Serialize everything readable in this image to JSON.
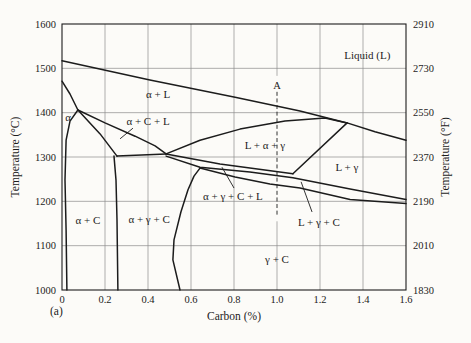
{
  "figure": {
    "label": "(a)",
    "background": "#fcfbf8",
    "line_color": "#1c1c1c",
    "grid_color": "#8c8c8c",
    "text_color": "#1c1c1c"
  },
  "chart_data": {
    "type": "line",
    "subtype": "phase-diagram",
    "xlabel": "Carbon (%)",
    "ylabel_left": "Temperature (°C)",
    "ylabel_right": "Temperature (°F)",
    "xlim": [
      0,
      1.6
    ],
    "ylim_left": [
      1000,
      1600
    ],
    "ylim_right": [
      1830,
      2910
    ],
    "grid": true,
    "x_ticks": [
      {
        "label": "0",
        "value": 0.0
      },
      {
        "label": "0.2",
        "value": 0.2
      },
      {
        "label": "0.4",
        "value": 0.4
      },
      {
        "label": "0.6",
        "value": 0.6
      },
      {
        "label": "0.8",
        "value": 0.8
      },
      {
        "label": "1.0",
        "value": 1.0
      },
      {
        "label": "1.2",
        "value": 1.2
      },
      {
        "label": "1.4",
        "value": 1.4
      },
      {
        "label": "1.6",
        "value": 1.6
      }
    ],
    "y_ticks_left": [
      {
        "label": "1600",
        "value": 1600
      },
      {
        "label": "1500",
        "value": 1500
      },
      {
        "label": "1400",
        "value": 1400
      },
      {
        "label": "1300",
        "value": 1300
      },
      {
        "label": "1200",
        "value": 1200
      },
      {
        "label": "1100",
        "value": 1100
      },
      {
        "label": "1000",
        "value": 1000
      }
    ],
    "y_ticks_right": [
      {
        "label": "2910",
        "value": 1600
      },
      {
        "label": "2730",
        "value": 1500
      },
      {
        "label": "2550",
        "value": 1400
      },
      {
        "label": "2370",
        "value": 1300
      },
      {
        "label": "2190",
        "value": 1200
      },
      {
        "label": "2010",
        "value": 1100
      },
      {
        "label": "1830",
        "value": 1000
      }
    ],
    "boundaries": [
      {
        "id": "liquidus",
        "points": [
          [
            0,
            1517
          ],
          [
            0.409,
            1474
          ],
          [
            0.805,
            1435
          ],
          [
            1.107,
            1404
          ],
          [
            1.326,
            1377
          ],
          [
            1.456,
            1357
          ],
          [
            1.6,
            1338
          ]
        ]
      },
      {
        "id": "alpha-upper-left",
        "points": [
          [
            0,
            1471
          ],
          [
            0.037,
            1442
          ],
          [
            0.074,
            1406
          ]
        ]
      },
      {
        "id": "alpha-right",
        "points": [
          [
            0.074,
            1406
          ],
          [
            0.037,
            1381
          ],
          [
            0.019,
            1338
          ],
          [
            0.014,
            1248
          ],
          [
            0.019,
            1135
          ],
          [
            0.023,
            1000
          ]
        ]
      },
      {
        "id": "alpha-c-l-left",
        "points": [
          [
            0.074,
            1406
          ],
          [
            0.177,
            1352
          ],
          [
            0.256,
            1302
          ]
        ]
      },
      {
        "id": "alpha-l-lower",
        "points": [
          [
            0.074,
            1406
          ],
          [
            0.2,
            1377
          ],
          [
            0.34,
            1347
          ],
          [
            0.433,
            1325
          ],
          [
            0.484,
            1307
          ]
        ]
      },
      {
        "id": "eutectic-shelf",
        "points": [
          [
            0.256,
            1302
          ],
          [
            0.484,
            1307
          ]
        ]
      },
      {
        "id": "l-alpha-gamma-upper",
        "points": [
          [
            0.484,
            1307
          ],
          [
            0.642,
            1338
          ],
          [
            0.828,
            1363
          ],
          [
            1.037,
            1381
          ],
          [
            1.223,
            1388
          ],
          [
            1.326,
            1377
          ]
        ]
      },
      {
        "id": "l-gamma-left",
        "points": [
          [
            1.326,
            1377
          ],
          [
            1.074,
            1262
          ]
        ]
      },
      {
        "id": "band-top",
        "points": [
          [
            0.484,
            1307
          ],
          [
            0.735,
            1284
          ],
          [
            1.074,
            1262
          ]
        ]
      },
      {
        "id": "band-middle",
        "points": [
          [
            0.484,
            1302
          ],
          [
            0.642,
            1277
          ],
          [
            0.874,
            1266
          ],
          [
            1.074,
            1253
          ],
          [
            1.34,
            1228
          ],
          [
            1.6,
            1204
          ]
        ]
      },
      {
        "id": "band-bottom",
        "points": [
          [
            0.642,
            1275
          ],
          [
            0.805,
            1255
          ],
          [
            0.967,
            1239
          ],
          [
            1.107,
            1230
          ],
          [
            1.34,
            1204
          ],
          [
            1.6,
            1195
          ]
        ]
      },
      {
        "id": "gamma-c-left",
        "points": [
          [
            0.549,
            1000
          ],
          [
            0.516,
            1068
          ],
          [
            0.521,
            1113
          ],
          [
            0.553,
            1176
          ],
          [
            0.586,
            1226
          ],
          [
            0.614,
            1257
          ],
          [
            0.642,
            1275
          ]
        ]
      },
      {
        "id": "alpha-c-right",
        "points": [
          [
            0.242,
            1302
          ],
          [
            0.251,
            1248
          ],
          [
            0.256,
            1158
          ],
          [
            0.26,
            1000
          ]
        ]
      }
    ],
    "dashed_line": {
      "x": 1.0,
      "t_top": 1447,
      "t_bottom": 1170,
      "label": "A",
      "label_t": 1462,
      "grid_gap": [
        1483,
        1155
      ]
    },
    "leaders": [
      {
        "for": "alpha-c-l",
        "points": [
          [
            0.33,
            1365
          ],
          [
            0.27,
            1341
          ]
        ]
      },
      {
        "for": "alpha-gamma-c-l",
        "points": [
          [
            0.8,
            1230
          ],
          [
            0.744,
            1277
          ]
        ]
      },
      {
        "for": "l-gamma-c",
        "points": [
          [
            1.163,
            1176
          ],
          [
            1.112,
            1244
          ]
        ]
      }
    ],
    "region_labels": [
      {
        "id": "liquid",
        "text": "Liquid (L)",
        "x": 1.42,
        "y": 1528
      },
      {
        "id": "alpha-l",
        "text": "α + L",
        "x": 0.447,
        "y": 1440
      },
      {
        "id": "alpha",
        "text": "α",
        "x": 0.028,
        "y": 1390
      },
      {
        "id": "alpha-c-l",
        "text": "α + C + L",
        "x": 0.4,
        "y": 1379
      },
      {
        "id": "l-alpha-gamma",
        "text": "L + α + γ",
        "x": 0.944,
        "y": 1327
      },
      {
        "id": "l-gamma",
        "text": "L + γ",
        "x": 1.325,
        "y": 1277
      },
      {
        "id": "alpha-gamma-c-l",
        "text": "α + γ + C + L",
        "x": 0.795,
        "y": 1212
      },
      {
        "id": "l-gamma-c",
        "text": "L + γ + C",
        "x": 1.195,
        "y": 1153
      },
      {
        "id": "alpha-c",
        "text": "α + C",
        "x": 0.121,
        "y": 1156
      },
      {
        "id": "alpha-gamma-c",
        "text": "α + γ + C",
        "x": 0.405,
        "y": 1158
      },
      {
        "id": "gamma-c",
        "text": "γ + C",
        "x": 1.0,
        "y": 1068
      }
    ]
  }
}
